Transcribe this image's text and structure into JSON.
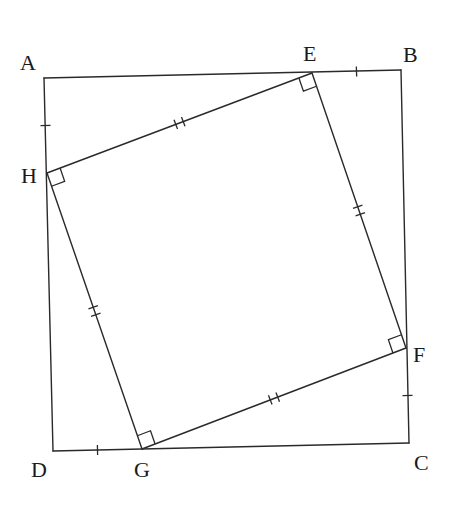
{
  "diagram": {
    "outer_square": {
      "name": "ABCD",
      "vertices": [
        "A",
        "B",
        "C",
        "D"
      ]
    },
    "inner_square": {
      "name": "EFGH",
      "vertices": [
        "E",
        "F",
        "G",
        "H"
      ]
    },
    "labels": {
      "A": "A",
      "B": "B",
      "C": "C",
      "D": "D",
      "E": "E",
      "F": "F",
      "G": "G",
      "H": "H"
    },
    "single_tick_segments": [
      "AH",
      "EB",
      "FC",
      "DG"
    ],
    "double_tick_segments": [
      "HE",
      "EF",
      "FG",
      "GH"
    ],
    "right_angles_at": [
      "E",
      "F",
      "G",
      "H"
    ],
    "line_color": "#2a2a2a",
    "label_color": "#1a1a1a"
  }
}
